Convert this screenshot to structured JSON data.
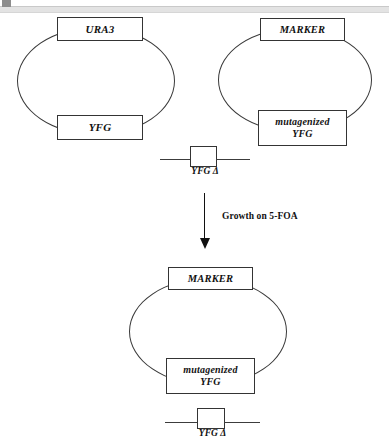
{
  "figure": {
    "domain_label": "plasmid-shuffle-schematic",
    "background_color": "#ffffff",
    "line_color": "#343434",
    "text_color": "#111111"
  },
  "artifacts": {
    "top_scan_band_color": "#e3e3e3",
    "corner_mark_color": "#8d8d8d"
  },
  "plasmids": [
    {
      "id": "plasmid-ura3",
      "top_gene": "URA3",
      "bottom_gene": "YFG"
    },
    {
      "id": "plasmid-marker-mutagenized",
      "top_gene": "MARKER",
      "bottom_gene_line1": "mutagenized",
      "bottom_gene_line2": "YFG"
    },
    {
      "id": "plasmid-result",
      "top_gene": "MARKER",
      "bottom_gene_line1": "mutagenized",
      "bottom_gene_line2": "YFG"
    }
  ],
  "constructs": [
    {
      "id": "yfg-delta-top",
      "label": "YFG Δ"
    },
    {
      "id": "yfg-delta-bottom",
      "label": "YFG Δ"
    }
  ],
  "arrow": {
    "label": "Growth on 5-FOA",
    "direction": "down"
  }
}
